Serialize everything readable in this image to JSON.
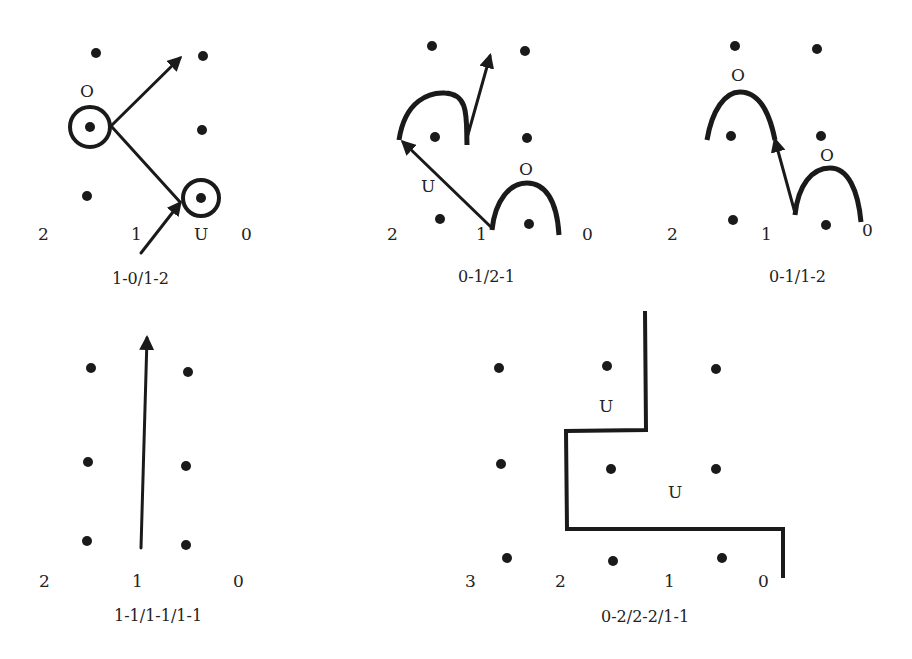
{
  "panels": [
    {
      "id": "p1",
      "caption": "1-0/1-2",
      "position_labels": [
        "2",
        "1",
        "U",
        "0"
      ],
      "markers": [
        "O"
      ]
    },
    {
      "id": "p2",
      "caption": "0-1/2-1",
      "position_labels": [
        "2",
        "1",
        "0"
      ],
      "markers": [
        "U",
        "O"
      ]
    },
    {
      "id": "p3",
      "caption": "0-1/1-2",
      "position_labels": [
        "2",
        "1",
        "0"
      ],
      "markers": [
        "O",
        "O"
      ]
    },
    {
      "id": "p4",
      "caption": "1-1/1-1/1-1",
      "position_labels": [
        "2",
        "1",
        "0"
      ],
      "markers": []
    },
    {
      "id": "p5",
      "caption": "0-2/2-2/1-1",
      "position_labels": [
        "3",
        "2",
        "1",
        "0"
      ],
      "markers": [
        "U",
        "U"
      ]
    }
  ],
  "colors": {
    "ink": "#1a1a1a",
    "background": "#ffffff"
  }
}
